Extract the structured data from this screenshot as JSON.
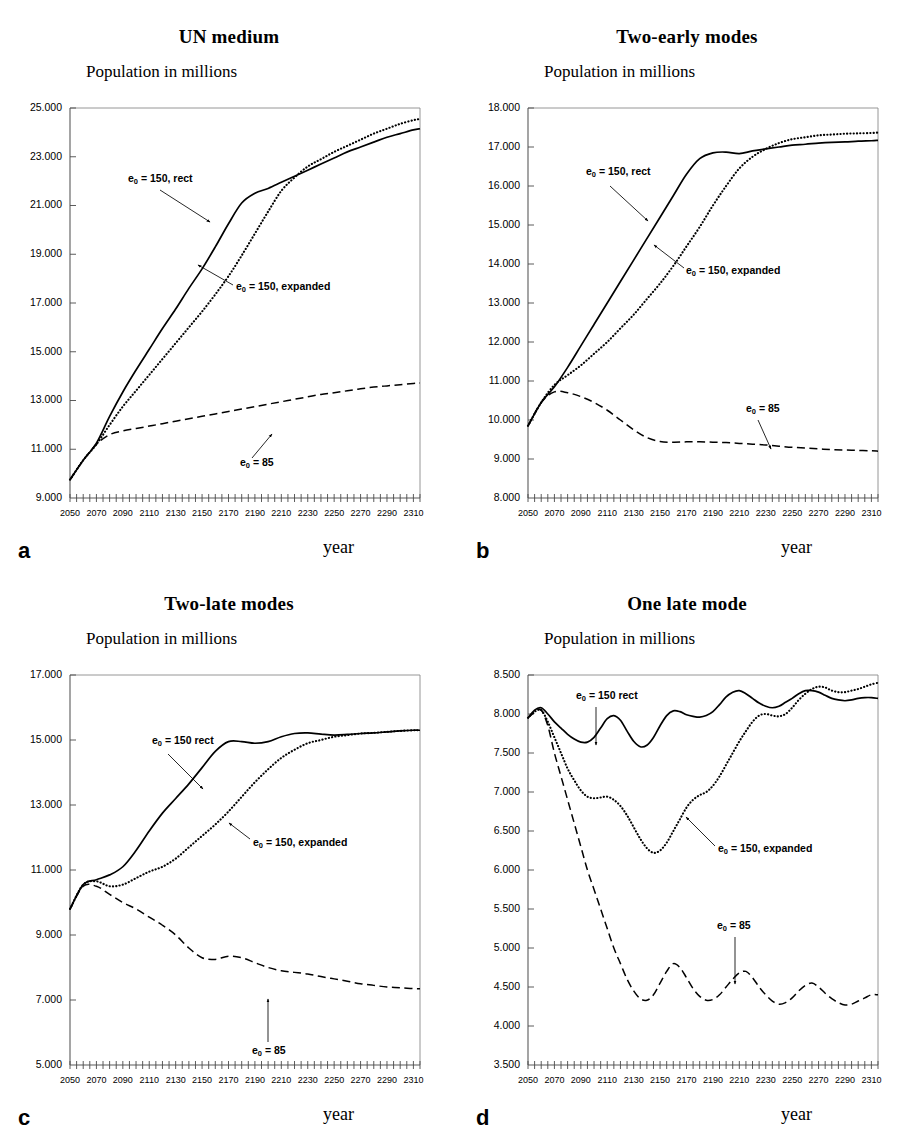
{
  "figure": {
    "axis_title": "Population in millions",
    "xlabel": "year",
    "xtick_labels": [
      "2050",
      "2070",
      "2090",
      "2110",
      "2130",
      "2150",
      "2170",
      "2190",
      "2210",
      "2230",
      "2250",
      "2270",
      "2290",
      "2310"
    ],
    "annotations": {
      "rect": "e",
      "rect_sub": "0",
      "rect_rest": " = 150, rect",
      "rect_rest_nocomma": " = 150 rect",
      "expanded_rest": " = 150, expanded",
      "e85_rest": " = 85"
    }
  },
  "panels": [
    {
      "letter": "a",
      "title": "UN medium",
      "ylabels": [
        "9.000",
        "11.000",
        "13.000",
        "15.000",
        "17.000",
        "19.000",
        "21.000",
        "23.000",
        "25.000"
      ]
    },
    {
      "letter": "b",
      "title": "Two-early modes",
      "ylabels": [
        "8.000",
        "9.000",
        "10.000",
        "11.000",
        "12.000",
        "13.000",
        "14.000",
        "15.000",
        "16.000",
        "17.000",
        "18.000"
      ]
    },
    {
      "letter": "c",
      "title": "Two-late modes",
      "ylabels": [
        "5.000",
        "7.000",
        "9.000",
        "11.000",
        "13.000",
        "15.000",
        "17.000"
      ]
    },
    {
      "letter": "d",
      "title": "One late mode",
      "ylabels": [
        "3.500",
        "4.000",
        "4.500",
        "5.000",
        "5.500",
        "6.000",
        "6.500",
        "7.000",
        "7.500",
        "8.000",
        "8.500"
      ]
    }
  ],
  "chart_data": [
    {
      "type": "line",
      "panel": "a",
      "title": "UN medium",
      "xlabel": "year",
      "ylabel": "Population in millions",
      "xlim": [
        2050,
        2315
      ],
      "ylim": [
        9.0,
        25.0
      ],
      "ytick_step": 2.0,
      "xtick_step_minor": 5,
      "xtick_step_major": 20,
      "grid": false,
      "legend": "inline-annotations",
      "x": [
        2050,
        2060,
        2070,
        2080,
        2090,
        2100,
        2110,
        2120,
        2130,
        2140,
        2150,
        2160,
        2170,
        2180,
        2190,
        2200,
        2210,
        2220,
        2230,
        2240,
        2250,
        2260,
        2270,
        2280,
        2290,
        2300,
        2310,
        2315
      ],
      "series": [
        {
          "name": "e0 = 150, rect",
          "style": "solid",
          "values": [
            9.75,
            10.55,
            11.25,
            12.35,
            13.35,
            14.25,
            15.1,
            15.95,
            16.75,
            17.6,
            18.4,
            19.3,
            20.25,
            21.1,
            21.5,
            21.7,
            21.95,
            22.2,
            22.45,
            22.7,
            22.95,
            23.2,
            23.4,
            23.6,
            23.8,
            23.95,
            24.1,
            24.15
          ]
        },
        {
          "name": "e0 = 150, expanded",
          "style": "dotted",
          "values": [
            9.75,
            10.55,
            11.2,
            12.0,
            12.75,
            13.4,
            14.05,
            14.7,
            15.35,
            16.0,
            16.65,
            17.35,
            18.1,
            18.95,
            19.85,
            20.75,
            21.6,
            22.15,
            22.6,
            22.9,
            23.2,
            23.45,
            23.7,
            23.95,
            24.15,
            24.35,
            24.5,
            24.55
          ]
        },
        {
          "name": "e0 = 85",
          "style": "dashed",
          "values": [
            9.75,
            10.55,
            11.2,
            11.6,
            11.75,
            11.85,
            11.95,
            12.05,
            12.15,
            12.25,
            12.35,
            12.45,
            12.55,
            12.65,
            12.75,
            12.85,
            12.95,
            13.05,
            13.15,
            13.25,
            13.32,
            13.4,
            13.48,
            13.55,
            13.6,
            13.65,
            13.7,
            13.72
          ]
        }
      ]
    },
    {
      "type": "line",
      "panel": "b",
      "title": "Two-early modes",
      "xlabel": "year",
      "ylabel": "Population in millions",
      "xlim": [
        2050,
        2315
      ],
      "ylim": [
        8.0,
        18.0
      ],
      "ytick_step": 1.0,
      "xtick_step_minor": 5,
      "xtick_step_major": 20,
      "grid": false,
      "legend": "inline-annotations",
      "x": [
        2050,
        2060,
        2070,
        2080,
        2090,
        2100,
        2110,
        2120,
        2130,
        2140,
        2150,
        2160,
        2170,
        2180,
        2190,
        2200,
        2210,
        2220,
        2230,
        2240,
        2250,
        2260,
        2270,
        2280,
        2290,
        2300,
        2310,
        2315
      ],
      "series": [
        {
          "name": "e0 = 150, rect",
          "style": "solid",
          "values": [
            9.85,
            10.45,
            10.85,
            11.35,
            11.9,
            12.45,
            13.0,
            13.55,
            14.1,
            14.65,
            15.2,
            15.75,
            16.3,
            16.7,
            16.85,
            16.87,
            16.83,
            16.9,
            16.95,
            17.0,
            17.05,
            17.07,
            17.1,
            17.12,
            17.13,
            17.15,
            17.16,
            17.17
          ]
        },
        {
          "name": "e0 = 150, expanded",
          "style": "dotted",
          "values": [
            9.85,
            10.45,
            10.9,
            11.15,
            11.4,
            11.7,
            12.0,
            12.35,
            12.7,
            13.1,
            13.5,
            13.95,
            14.45,
            14.95,
            15.5,
            16.0,
            16.45,
            16.75,
            16.95,
            17.1,
            17.2,
            17.25,
            17.3,
            17.32,
            17.34,
            17.35,
            17.36,
            17.37
          ]
        },
        {
          "name": "e0 = 85",
          "style": "dashed",
          "values": [
            9.85,
            10.45,
            10.72,
            10.7,
            10.6,
            10.45,
            10.25,
            10.0,
            9.75,
            9.55,
            9.45,
            9.43,
            9.44,
            9.44,
            9.43,
            9.42,
            9.4,
            9.38,
            9.36,
            9.33,
            9.3,
            9.28,
            9.26,
            9.24,
            9.23,
            9.22,
            9.21,
            9.2
          ]
        }
      ]
    },
    {
      "type": "line",
      "panel": "c",
      "title": "Two-late modes",
      "xlabel": "year",
      "ylabel": "Population in millions",
      "xlim": [
        2050,
        2315
      ],
      "ylim": [
        5.0,
        17.0
      ],
      "ytick_step": 2.0,
      "xtick_step_minor": 5,
      "xtick_step_major": 20,
      "grid": false,
      "legend": "inline-annotations",
      "x": [
        2050,
        2060,
        2070,
        2080,
        2090,
        2100,
        2110,
        2120,
        2130,
        2140,
        2150,
        2160,
        2170,
        2180,
        2190,
        2200,
        2210,
        2220,
        2230,
        2240,
        2250,
        2260,
        2270,
        2280,
        2290,
        2300,
        2310,
        2315
      ],
      "series": [
        {
          "name": "e0 = 150 rect",
          "style": "solid",
          "values": [
            9.8,
            10.55,
            10.7,
            10.85,
            11.1,
            11.6,
            12.2,
            12.75,
            13.2,
            13.65,
            14.15,
            14.65,
            14.95,
            14.95,
            14.9,
            14.95,
            15.1,
            15.2,
            15.22,
            15.18,
            15.15,
            15.17,
            15.2,
            15.22,
            15.25,
            15.28,
            15.3,
            15.3
          ]
        },
        {
          "name": "e0 = 150, expanded",
          "style": "dotted",
          "values": [
            9.8,
            10.55,
            10.65,
            10.5,
            10.55,
            10.75,
            10.95,
            11.1,
            11.35,
            11.7,
            12.05,
            12.4,
            12.8,
            13.25,
            13.7,
            14.1,
            14.45,
            14.7,
            14.9,
            15.0,
            15.1,
            15.15,
            15.2,
            15.22,
            15.25,
            15.28,
            15.3,
            15.3
          ]
        },
        {
          "name": "e0 = 85",
          "style": "dashed",
          "values": [
            9.8,
            10.5,
            10.5,
            10.25,
            10.0,
            9.8,
            9.55,
            9.3,
            9.0,
            8.6,
            8.3,
            8.25,
            8.35,
            8.3,
            8.15,
            8.0,
            7.9,
            7.85,
            7.8,
            7.72,
            7.65,
            7.58,
            7.5,
            7.45,
            7.4,
            7.38,
            7.35,
            7.35
          ]
        }
      ]
    },
    {
      "type": "line",
      "panel": "d",
      "title": "One late mode",
      "xlabel": "year",
      "ylabel": "Population in millions",
      "xlim": [
        2050,
        2315
      ],
      "ylim": [
        3.5,
        8.5
      ],
      "ytick_step": 0.5,
      "xtick_step_minor": 5,
      "xtick_step_major": 20,
      "grid": false,
      "legend": "inline-annotations",
      "x": [
        2050,
        2055,
        2060,
        2065,
        2070,
        2075,
        2080,
        2085,
        2090,
        2095,
        2100,
        2105,
        2110,
        2115,
        2120,
        2125,
        2130,
        2135,
        2140,
        2145,
        2150,
        2155,
        2160,
        2165,
        2170,
        2175,
        2180,
        2185,
        2190,
        2195,
        2200,
        2205,
        2210,
        2215,
        2220,
        2225,
        2230,
        2235,
        2240,
        2245,
        2250,
        2255,
        2260,
        2265,
        2270,
        2275,
        2280,
        2285,
        2290,
        2295,
        2300,
        2305,
        2310,
        2315
      ],
      "series": [
        {
          "name": "e0 = 150 rect",
          "style": "solid",
          "values": [
            7.95,
            8.05,
            8.08,
            8.0,
            7.9,
            7.82,
            7.74,
            7.68,
            7.64,
            7.64,
            7.7,
            7.82,
            7.94,
            7.98,
            7.92,
            7.78,
            7.65,
            7.58,
            7.6,
            7.7,
            7.85,
            7.98,
            8.04,
            8.03,
            7.99,
            7.97,
            7.96,
            7.98,
            8.03,
            8.12,
            8.22,
            8.28,
            8.3,
            8.26,
            8.2,
            8.14,
            8.1,
            8.08,
            8.1,
            8.15,
            8.2,
            8.26,
            8.3,
            8.3,
            8.28,
            8.24,
            8.2,
            8.18,
            8.17,
            8.18,
            8.2,
            8.21,
            8.21,
            8.2
          ]
        },
        {
          "name": "e0 = 150, expanded",
          "style": "dotted",
          "values": [
            7.95,
            8.03,
            8.05,
            7.9,
            7.7,
            7.5,
            7.3,
            7.15,
            7.02,
            6.94,
            6.92,
            6.93,
            6.94,
            6.9,
            6.82,
            6.7,
            6.55,
            6.4,
            6.28,
            6.22,
            6.25,
            6.35,
            6.5,
            6.65,
            6.8,
            6.9,
            6.96,
            7.0,
            7.08,
            7.2,
            7.35,
            7.5,
            7.65,
            7.78,
            7.9,
            7.98,
            8.0,
            7.98,
            7.97,
            8.0,
            8.08,
            8.18,
            8.26,
            8.32,
            8.35,
            8.34,
            8.3,
            8.28,
            8.28,
            8.3,
            8.32,
            8.35,
            8.38,
            8.4
          ]
        },
        {
          "name": "e0 = 85",
          "style": "dashed",
          "values": [
            7.95,
            8.02,
            8.05,
            7.85,
            7.5,
            7.2,
            6.9,
            6.6,
            6.3,
            6.0,
            5.75,
            5.5,
            5.25,
            5.0,
            4.8,
            4.6,
            4.45,
            4.35,
            4.33,
            4.4,
            4.55,
            4.7,
            4.8,
            4.75,
            4.62,
            4.48,
            4.38,
            4.33,
            4.34,
            4.4,
            4.5,
            4.6,
            4.68,
            4.7,
            4.62,
            4.5,
            4.4,
            4.32,
            4.28,
            4.3,
            4.36,
            4.45,
            4.52,
            4.55,
            4.5,
            4.42,
            4.35,
            4.3,
            4.27,
            4.28,
            4.32,
            4.36,
            4.4,
            4.4
          ]
        }
      ]
    }
  ]
}
